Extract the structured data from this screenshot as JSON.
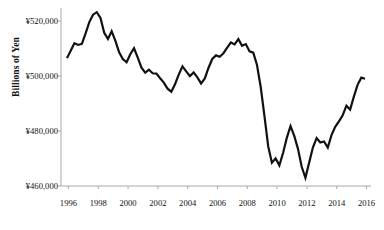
{
  "chart_data": {
    "type": "line",
    "title": "",
    "xlabel": "",
    "ylabel": "Billions of Yen",
    "xlim": [
      1995.5,
      2016.3
    ],
    "ylim": [
      460000,
      524000
    ],
    "y_ticks": [
      460000,
      480000,
      500000,
      520000
    ],
    "y_tick_labels": [
      "¥460,000",
      "¥480,000",
      "¥500,000",
      "¥520,000"
    ],
    "x_ticks": [
      1996,
      1998,
      2000,
      2002,
      2004,
      2006,
      2008,
      2010,
      2012,
      2014,
      2016
    ],
    "x_tick_labels": [
      "1996",
      "1998",
      "2000",
      "2002",
      "2004",
      "2006",
      "2008",
      "2010",
      "2012",
      "2014",
      "2016"
    ],
    "grid": false,
    "legend": null,
    "line_color": "#111111",
    "line_width": 2.2,
    "axis_color": "#a9a9a9",
    "series": [
      {
        "name": "Billions of Yen",
        "x": [
          1995.9,
          1996.15,
          1996.4,
          1996.65,
          1996.9,
          1997.15,
          1997.4,
          1997.65,
          1997.9,
          1998.15,
          1998.4,
          1998.65,
          1998.9,
          1999.15,
          1999.4,
          1999.65,
          1999.9,
          2000.15,
          2000.4,
          2000.65,
          2000.9,
          2001.15,
          2001.4,
          2001.65,
          2001.9,
          2002.15,
          2002.4,
          2002.65,
          2002.9,
          2003.15,
          2003.4,
          2003.65,
          2003.9,
          2004.15,
          2004.4,
          2004.65,
          2004.9,
          2005.15,
          2005.4,
          2005.65,
          2005.9,
          2006.15,
          2006.4,
          2006.65,
          2006.9,
          2007.15,
          2007.4,
          2007.65,
          2007.9,
          2008.15,
          2008.4,
          2008.65,
          2008.9,
          2009.15,
          2009.4,
          2009.65,
          2009.9,
          2010.15,
          2010.4,
          2010.65,
          2010.9,
          2011.15,
          2011.4,
          2011.65,
          2011.9,
          2012.15,
          2012.4,
          2012.65,
          2012.9,
          2013.15,
          2013.4,
          2013.65,
          2013.9,
          2014.15,
          2014.4,
          2014.65,
          2014.9,
          2015.15,
          2015.4,
          2015.65,
          2015.9
        ],
        "values": [
          506500,
          509200,
          511900,
          511300,
          511700,
          515500,
          519600,
          522300,
          523200,
          521100,
          515700,
          513500,
          516300,
          512800,
          508600,
          506200,
          505000,
          507900,
          510100,
          506700,
          503000,
          501200,
          502300,
          501000,
          500900,
          499200,
          497600,
          495400,
          494300,
          497000,
          500500,
          503500,
          501700,
          500000,
          501300,
          499500,
          497300,
          499100,
          503000,
          506200,
          507500,
          507000,
          508300,
          510300,
          512200,
          511500,
          513400,
          511000,
          511600,
          509000,
          508500,
          504000,
          496000,
          485500,
          474500,
          468500,
          470000,
          467500,
          472000,
          477500,
          481800,
          478200,
          473500,
          467000,
          463000,
          468500,
          474000,
          477400,
          475800,
          476200,
          474000,
          478500,
          481500,
          483500,
          485700,
          489200,
          487800,
          492500,
          496800,
          499400,
          499000
        ]
      }
    ]
  }
}
